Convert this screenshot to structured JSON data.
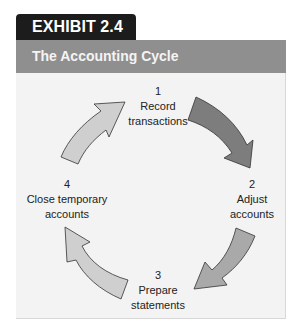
{
  "exhibit": {
    "tab_label": "EXHIBIT 2.4",
    "title": "The Accounting Cycle"
  },
  "steps": [
    {
      "number": "1",
      "line1": "Record",
      "line2": "transactions"
    },
    {
      "number": "2",
      "line1": "Adjust",
      "line2": "accounts"
    },
    {
      "number": "3",
      "line1": "Prepare",
      "line2": "statements"
    },
    {
      "number": "4",
      "line1": "Close temporary",
      "line2": "accounts"
    }
  ],
  "arrows": [
    {
      "from": "1",
      "to": "2",
      "color": "#7d7d7d"
    },
    {
      "from": "2",
      "to": "3",
      "color": "#a9a9a9"
    },
    {
      "from": "3",
      "to": "4",
      "color": "#cfcfcf"
    },
    {
      "from": "4",
      "to": "1",
      "color": "#cfcfcf"
    }
  ],
  "colors": {
    "tab_bg": "#1c1c1c",
    "header_bg": "#8f8f8f",
    "panel_bg": "#f3f3f3"
  }
}
